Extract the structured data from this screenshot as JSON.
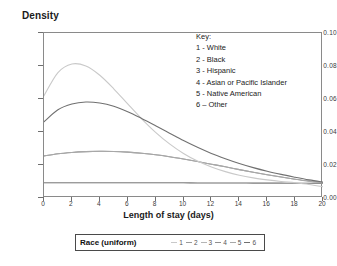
{
  "axis": {
    "y_title": "Density",
    "x_title": "Length of stay (days)",
    "y_ticks": [
      "0.10",
      "0.08",
      "0.06",
      "0.04",
      "0.02",
      "0.00"
    ],
    "x_ticks": [
      "0",
      "2",
      "4",
      "6",
      "8",
      "10",
      "12",
      "14",
      "16",
      "18",
      "20"
    ]
  },
  "key": {
    "heading": "Key:",
    "entries": [
      "1 - White",
      "2 - Black",
      "3 - Hispanic",
      "4 - Asian or Pacific Islander",
      "5 - Native American",
      "6 – Other"
    ]
  },
  "legend_bar": {
    "title": "Race (uniform)",
    "items": [
      {
        "num": "1",
        "color": "#c9c9c9"
      },
      {
        "num": "2",
        "color": "#9a9a9a"
      },
      {
        "num": "3",
        "color": "#b5b5b5"
      },
      {
        "num": "4",
        "color": "#8f8f8f"
      },
      {
        "num": "5",
        "color": "#a8a8a8"
      },
      {
        "num": "6",
        "color": "#707070"
      }
    ]
  },
  "chart_data": {
    "type": "line",
    "title": "",
    "xlabel": "Length of stay (days)",
    "ylabel": "Density",
    "xlim": [
      0,
      20
    ],
    "ylim": [
      0,
      0.1
    ],
    "xticks": [
      0,
      2,
      4,
      6,
      8,
      10,
      12,
      14,
      16,
      18,
      20
    ],
    "yticks": [
      0.0,
      0.02,
      0.04,
      0.06,
      0.08,
      0.1
    ],
    "grid": false,
    "legend_position": "bottom",
    "x": [
      0,
      1,
      2,
      3,
      4,
      5,
      6,
      7,
      8,
      9,
      10,
      11,
      12,
      13,
      14,
      15,
      16,
      17,
      18,
      19,
      20
    ],
    "series": [
      {
        "name": "1 - White",
        "color": "#c9c9c9",
        "values": [
          0.062,
          0.076,
          0.0812,
          0.08,
          0.0744,
          0.0662,
          0.057,
          0.048,
          0.0398,
          0.0328,
          0.027,
          0.0224,
          0.0188,
          0.016,
          0.0138,
          0.0122,
          0.011,
          0.01,
          0.0092,
          0.0082,
          0.0068
        ]
      },
      {
        "name": "2 - Black",
        "color": "#9a9a9a",
        "values": [
          0.0255,
          0.0268,
          0.0276,
          0.0281,
          0.0283,
          0.0282,
          0.0278,
          0.0271,
          0.0262,
          0.025,
          0.0236,
          0.0221,
          0.0205,
          0.0189,
          0.0172,
          0.0156,
          0.0141,
          0.0127,
          0.0114,
          0.0102,
          0.0092
        ]
      },
      {
        "name": "3 - Hispanic",
        "color": "#b5b5b5",
        "values": [
          0.0092,
          0.0092,
          0.0092,
          0.0092,
          0.0092,
          0.0092,
          0.0092,
          0.0092,
          0.0092,
          0.0092,
          0.0092,
          0.0091,
          0.0091,
          0.0091,
          0.0091,
          0.009,
          0.009,
          0.009,
          0.0089,
          0.0089,
          0.0088
        ]
      },
      {
        "name": "4 - Asian or Pacific Islander",
        "color": "#8f8f8f",
        "values": [
          0.0092,
          0.0092,
          0.0092,
          0.0092,
          0.0092,
          0.0092,
          0.0092,
          0.0092,
          0.0092,
          0.0092,
          0.0092,
          0.0091,
          0.0091,
          0.0091,
          0.0091,
          0.009,
          0.009,
          0.009,
          0.0089,
          0.0089,
          0.0088
        ]
      },
      {
        "name": "5 - Native American",
        "color": "#a8a8a8",
        "values": [
          0.0255,
          0.0268,
          0.0276,
          0.0281,
          0.0283,
          0.0282,
          0.0278,
          0.0271,
          0.0262,
          0.025,
          0.0236,
          0.0221,
          0.0205,
          0.0189,
          0.0172,
          0.0156,
          0.0141,
          0.0127,
          0.0114,
          0.0102,
          0.0092
        ]
      },
      {
        "name": "6 – Other",
        "color": "#707070",
        "values": [
          0.0462,
          0.0535,
          0.057,
          0.0582,
          0.0576,
          0.0556,
          0.0523,
          0.0482,
          0.0438,
          0.0393,
          0.0348,
          0.0307,
          0.027,
          0.0238,
          0.0209,
          0.0184,
          0.0162,
          0.0143,
          0.0126,
          0.011,
          0.0096
        ]
      }
    ]
  }
}
